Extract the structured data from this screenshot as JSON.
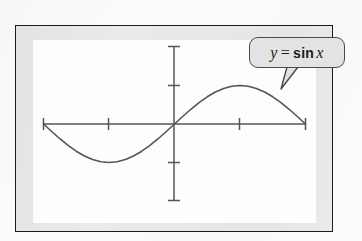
{
  "figure": {
    "kind": "math-textbook-figure",
    "caption_label": {
      "full_text": "y = sin x",
      "variable_y": "y",
      "equals": "=",
      "function": "sin",
      "variable_x": "x"
    },
    "frame": {
      "border_color": "#1b1b1b",
      "mat_color": "#eaeaea",
      "plot_background": "#fdfdfd"
    },
    "callout": {
      "fill_color": "#e3e3e3",
      "stroke_color": "#4a4a4a",
      "pointer_target_x": 281,
      "pointer_target_y": 89
    }
  },
  "chart_data": {
    "type": "line",
    "title": "",
    "subtitle": "",
    "xlabel": "",
    "ylabel": "",
    "annotations": [
      {
        "text": "y = sin x",
        "style": "rounded-callout",
        "points_to": "curve near x = 3pi/4"
      }
    ],
    "legend": [],
    "legend_position": "none",
    "grid": false,
    "axis_style": "centered-crosshair-with-end-caps",
    "xlim": [
      -3.1416,
      3.1416
    ],
    "ylim": [
      -1.6,
      1.6
    ],
    "xticks": [
      -1.5708,
      1.5708
    ],
    "xticklabels": [
      "",
      ""
    ],
    "yticks": [
      -1,
      1
    ],
    "yticklabels": [
      "",
      ""
    ],
    "series": [
      {
        "name": "y = sin x",
        "color": "#555555",
        "linewidth": 1.6,
        "x": [
          -3.1416,
          -2.9452,
          -2.7489,
          -2.5525,
          -2.3562,
          -2.1598,
          -1.9635,
          -1.7671,
          -1.5708,
          -1.3744,
          -1.1781,
          -0.9817,
          -0.7854,
          -0.589,
          -0.3927,
          -0.1963,
          0,
          0.1963,
          0.3927,
          0.589,
          0.7854,
          0.9817,
          1.1781,
          1.3744,
          1.5708,
          1.7671,
          1.9635,
          2.1598,
          2.3562,
          2.5525,
          2.7489,
          2.9452,
          3.1416
        ],
        "y": [
          0,
          -0.1951,
          -0.3827,
          -0.5556,
          -0.7071,
          -0.8315,
          -0.9239,
          -0.9808,
          -1,
          -0.9808,
          -0.9239,
          -0.8315,
          -0.7071,
          -0.5556,
          -0.3827,
          -0.1951,
          0,
          0.1951,
          0.3827,
          0.5556,
          0.7071,
          0.8315,
          0.9239,
          0.9808,
          1,
          0.9808,
          0.9239,
          0.8315,
          0.7071,
          0.5556,
          0.3827,
          0.1951,
          0
        ]
      }
    ]
  }
}
